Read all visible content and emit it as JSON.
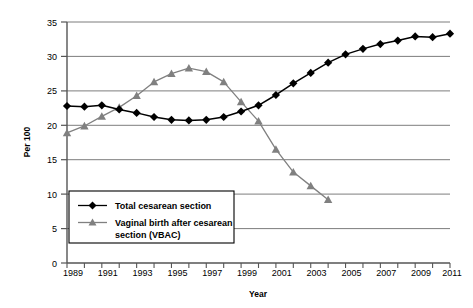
{
  "chart_data": {
    "type": "line",
    "title": "",
    "xlabel": "Year",
    "ylabel": "Per 100",
    "xlim": [
      1989,
      2011
    ],
    "ylim": [
      0,
      35
    ],
    "yticks": [
      0,
      5,
      10,
      15,
      20,
      25,
      30,
      35
    ],
    "ytick_labels": [
      "0",
      "5",
      "10",
      "15",
      "20",
      "25",
      "30",
      "35"
    ],
    "xticks": [
      1989,
      1990,
      1991,
      1992,
      1993,
      1994,
      1995,
      1996,
      1997,
      1998,
      1999,
      2000,
      2001,
      2002,
      2003,
      2004,
      2005,
      2006,
      2007,
      2008,
      2009,
      2010,
      2011
    ],
    "xtick_labels": [
      "1989",
      "1991",
      "1993",
      "1995",
      "1997",
      "1999",
      "2001",
      "2003",
      "2005",
      "2007",
      "2009",
      "2011"
    ],
    "xtick_labeled_values": [
      1989,
      1991,
      1993,
      1995,
      1997,
      1999,
      2001,
      2003,
      2005,
      2007,
      2009,
      2011
    ],
    "grid": "horizontal",
    "legend_position": "lower-left-inside",
    "series": [
      {
        "name": "Total cesarean section",
        "color": "#000000",
        "marker": "diamond",
        "x": [
          1989,
          1990,
          1991,
          1992,
          1993,
          1994,
          1995,
          1996,
          1997,
          1998,
          1999,
          2000,
          2001,
          2002,
          2003,
          2004,
          2005,
          2006,
          2007,
          2008,
          2009,
          2010,
          2011
        ],
        "values": [
          22.8,
          22.7,
          22.9,
          22.3,
          21.8,
          21.2,
          20.8,
          20.7,
          20.8,
          21.2,
          22.0,
          22.9,
          24.4,
          26.1,
          27.6,
          29.1,
          30.3,
          31.1,
          31.8,
          32.3,
          32.9,
          32.8,
          33.3
        ]
      },
      {
        "name": "Vaginal birth after cesarean section (VBAC)",
        "color": "#808080",
        "marker": "triangle",
        "x": [
          1989,
          1990,
          1991,
          1992,
          1993,
          1994,
          1995,
          1996,
          1997,
          1998,
          1999,
          2000,
          2001,
          2002,
          2003,
          2004
        ],
        "values": [
          18.9,
          19.9,
          21.3,
          22.6,
          24.3,
          26.3,
          27.5,
          28.3,
          27.8,
          26.3,
          23.4,
          20.6,
          16.5,
          13.2,
          11.2,
          9.2
        ]
      }
    ]
  },
  "axes": {
    "y_title": "Per 100",
    "x_title": "Year"
  },
  "legend": {
    "items": [
      {
        "label": "Total cesarean section",
        "color": "#000000",
        "marker": "diamond"
      },
      {
        "label": "Vaginal birth after cesarean",
        "color": "#808080",
        "marker": "triangle"
      },
      {
        "label": "section (VBAC)",
        "color": "#808080",
        "marker": "none"
      }
    ]
  },
  "ytick_labels": {
    "t0": "0",
    "t5": "5",
    "t10": "10",
    "t15": "15",
    "t20": "20",
    "t25": "25",
    "t30": "30",
    "t35": "35"
  },
  "xtick_labels": {
    "x1989": "1989",
    "x1991": "1991",
    "x1993": "1993",
    "x1995": "1995",
    "x1997": "1997",
    "x1999": "1999",
    "x2001": "2001",
    "x2003": "2003",
    "x2005": "2005",
    "x2007": "2007",
    "x2009": "2009",
    "x2011": "2011"
  }
}
